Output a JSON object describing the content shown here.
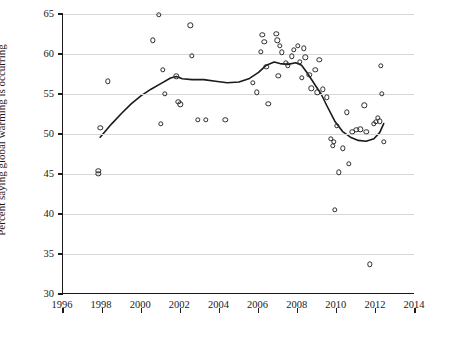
{
  "chart_data": {
    "type": "scatter",
    "title": "",
    "xlabel": "",
    "ylabel": "Percent saying global warming is occurring",
    "xlim": [
      1996,
      2014
    ],
    "ylim": [
      30,
      65
    ],
    "xticks": [
      1996,
      1998,
      2000,
      2002,
      2004,
      2006,
      2008,
      2010,
      2012,
      2014
    ],
    "yticks": [
      30,
      35,
      40,
      45,
      50,
      55,
      60,
      65
    ],
    "grid": "horizontal",
    "legend": "none",
    "series": [
      {
        "name": "Survey estimates",
        "type": "scatter",
        "marker": "open-circle",
        "points": [
          [
            1997.8,
            45.0
          ],
          [
            1997.8,
            45.4
          ],
          [
            1997.9,
            50.8
          ],
          [
            1998.3,
            56.6
          ],
          [
            2000.6,
            61.7
          ],
          [
            2000.9,
            64.9
          ],
          [
            2001.0,
            51.3
          ],
          [
            2001.1,
            58.0
          ],
          [
            2001.2,
            55.0
          ],
          [
            2001.8,
            57.2
          ],
          [
            2001.9,
            54.0
          ],
          [
            2002.0,
            53.7
          ],
          [
            2002.5,
            63.6
          ],
          [
            2002.6,
            59.8
          ],
          [
            2002.9,
            51.8
          ],
          [
            2003.3,
            51.8
          ],
          [
            2004.3,
            51.8
          ],
          [
            2005.7,
            56.4
          ],
          [
            2005.9,
            55.2
          ],
          [
            2006.1,
            60.3
          ],
          [
            2006.2,
            62.4
          ],
          [
            2006.3,
            61.5
          ],
          [
            2006.4,
            58.4
          ],
          [
            2006.5,
            53.8
          ],
          [
            2006.9,
            62.5
          ],
          [
            2006.95,
            61.7
          ],
          [
            2007.0,
            57.3
          ],
          [
            2007.1,
            61.0
          ],
          [
            2007.2,
            60.2
          ],
          [
            2007.4,
            58.9
          ],
          [
            2007.5,
            58.6
          ],
          [
            2007.7,
            59.7
          ],
          [
            2007.8,
            60.5
          ],
          [
            2008.0,
            61.0
          ],
          [
            2008.1,
            59.0
          ],
          [
            2008.2,
            57.0
          ],
          [
            2008.3,
            60.7
          ],
          [
            2008.4,
            59.6
          ],
          [
            2008.6,
            57.4
          ],
          [
            2008.7,
            55.7
          ],
          [
            2008.9,
            58.0
          ],
          [
            2009.0,
            55.2
          ],
          [
            2009.1,
            59.3
          ],
          [
            2009.3,
            55.6
          ],
          [
            2009.5,
            54.6
          ],
          [
            2009.7,
            49.4
          ],
          [
            2009.8,
            48.5
          ],
          [
            2009.85,
            49.0
          ],
          [
            2009.9,
            40.5
          ],
          [
            2010.0,
            51.0
          ],
          [
            2010.1,
            45.2
          ],
          [
            2010.3,
            48.2
          ],
          [
            2010.5,
            52.7
          ],
          [
            2010.6,
            46.3
          ],
          [
            2010.8,
            50.3
          ],
          [
            2011.0,
            50.5
          ],
          [
            2011.2,
            50.6
          ],
          [
            2011.4,
            53.6
          ],
          [
            2011.5,
            50.3
          ],
          [
            2011.7,
            33.7
          ],
          [
            2011.9,
            51.3
          ],
          [
            2012.0,
            51.5
          ],
          [
            2012.1,
            52.0
          ],
          [
            2012.2,
            51.6
          ],
          [
            2012.25,
            58.5
          ],
          [
            2012.3,
            55.0
          ],
          [
            2012.4,
            49.0
          ]
        ]
      },
      {
        "name": "Smoothed trend",
        "type": "line",
        "points": [
          [
            1997.9,
            49.6
          ],
          [
            1998.5,
            51.3
          ],
          [
            1999.0,
            52.6
          ],
          [
            1999.5,
            53.8
          ],
          [
            2000.0,
            54.8
          ],
          [
            2000.5,
            55.6
          ],
          [
            2001.0,
            56.3
          ],
          [
            2001.5,
            57.0
          ],
          [
            2001.8,
            57.2
          ],
          [
            2002.1,
            56.9
          ],
          [
            2002.6,
            56.8
          ],
          [
            2003.2,
            56.8
          ],
          [
            2003.8,
            56.6
          ],
          [
            2004.4,
            56.4
          ],
          [
            2005.0,
            56.5
          ],
          [
            2005.5,
            56.9
          ],
          [
            2006.0,
            57.7
          ],
          [
            2006.4,
            58.6
          ],
          [
            2006.8,
            59.0
          ],
          [
            2007.1,
            58.8
          ],
          [
            2007.5,
            58.7
          ],
          [
            2007.9,
            58.9
          ],
          [
            2008.2,
            58.6
          ],
          [
            2008.5,
            57.6
          ],
          [
            2008.9,
            56.1
          ],
          [
            2009.2,
            55.0
          ],
          [
            2009.5,
            53.5
          ],
          [
            2009.9,
            51.6
          ],
          [
            2010.3,
            50.3
          ],
          [
            2010.7,
            49.6
          ],
          [
            2011.1,
            49.2
          ],
          [
            2011.5,
            49.1
          ],
          [
            2011.9,
            49.4
          ],
          [
            2012.2,
            50.2
          ],
          [
            2012.4,
            51.3
          ]
        ]
      }
    ]
  }
}
